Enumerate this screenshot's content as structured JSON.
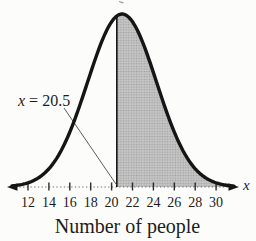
{
  "chart_data": {
    "type": "area",
    "subtype": "normal-distribution-curve",
    "title": "",
    "xlabel": "Number of people",
    "x_axis_letter": "x",
    "x_ticks": [
      12,
      14,
      16,
      18,
      20,
      22,
      24,
      26,
      28,
      30
    ],
    "x_tick_unit_start": 12,
    "x_range_visible": [
      10.5,
      31.7
    ],
    "mean": 21,
    "sd": 3.3,
    "curve_peak_at_x": 21,
    "shaded_region": {
      "from": 20.5,
      "to": 31.5,
      "side": "right-tail"
    },
    "annotation": {
      "text": "x = 20.5",
      "points_to_x": 20.5
    },
    "grid": false,
    "legend": null,
    "colors": {
      "curve": "#151515",
      "shade_base": "#c6c6c6",
      "shade_dot": "#9d9d9d",
      "axis_dots": "#6e6e6e",
      "tick": "#2b2b2b",
      "leader": "#4a4a4a",
      "text": "#1c1c1c",
      "background": "#fcfcfa"
    }
  }
}
